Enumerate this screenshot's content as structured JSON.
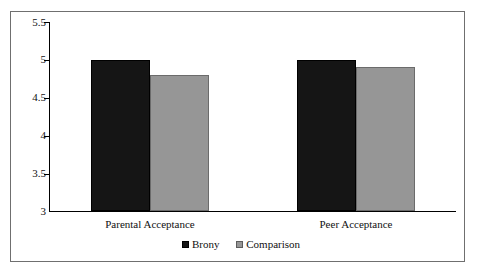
{
  "chart_data": {
    "type": "bar",
    "title": "",
    "xlabel": "",
    "ylabel": "",
    "categories": [
      "Parental Acceptance",
      "Peer Acceptance"
    ],
    "series": [
      {
        "name": "Brony",
        "color": "#151515",
        "values": [
          5.0,
          5.0
        ]
      },
      {
        "name": "Comparison",
        "color": "#969696",
        "values": [
          4.8,
          4.9
        ]
      }
    ],
    "ylim": [
      3,
      5.5
    ],
    "yticks": [
      3,
      3.5,
      4,
      4.5,
      5,
      5.5
    ],
    "ytick_labels": [
      "3",
      "3.5",
      "4",
      "4.5",
      "5",
      "5.5"
    ],
    "grid": false,
    "legend_position": "bottom"
  },
  "axis": {
    "y_labels": [
      "5.5",
      "5",
      "4.5",
      "4",
      "3.5",
      "3"
    ]
  },
  "categories": {
    "first": "Parental Acceptance",
    "second": "Peer Acceptance"
  },
  "legend": {
    "brony": "Brony",
    "comparison": "Comparison"
  },
  "colors": {
    "brony": "#151515",
    "comparison": "#969696",
    "frame": "#6f6f6f",
    "axis": "#000000"
  }
}
